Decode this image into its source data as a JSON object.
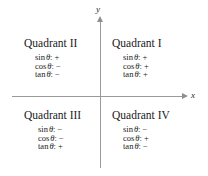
{
  "figure": {
    "title_semantic": "trigonometric-sign-quadrant-chart",
    "axes": {
      "x_label": "x",
      "y_label": "y",
      "axis_color": "#9a9a9a"
    },
    "quadrants": [
      {
        "id": "quadrant-1",
        "title": "Quadrant I",
        "rows": [
          {
            "func": "sin",
            "theta": "θ",
            "colon": ":",
            "sign": "+"
          },
          {
            "func": "cos",
            "theta": "θ",
            "colon": ":",
            "sign": "+"
          },
          {
            "func": "tan",
            "theta": "θ",
            "colon": ":",
            "sign": "+"
          }
        ]
      },
      {
        "id": "quadrant-2",
        "title": "Quadrant II",
        "rows": [
          {
            "func": "sin",
            "theta": "θ",
            "colon": ":",
            "sign": "+"
          },
          {
            "func": "cos",
            "theta": "θ",
            "colon": ":",
            "sign": "−"
          },
          {
            "func": "tan",
            "theta": "θ",
            "colon": ":",
            "sign": "−"
          }
        ]
      },
      {
        "id": "quadrant-3",
        "title": "Quadrant III",
        "rows": [
          {
            "func": "sin",
            "theta": "θ",
            "colon": ":",
            "sign": "−"
          },
          {
            "func": "cos",
            "theta": "θ",
            "colon": ":",
            "sign": "−"
          },
          {
            "func": "tan",
            "theta": "θ",
            "colon": ":",
            "sign": "+"
          }
        ]
      },
      {
        "id": "quadrant-4",
        "title": "Quadrant IV",
        "rows": [
          {
            "func": "sin",
            "theta": "θ",
            "colon": ":",
            "sign": "−"
          },
          {
            "func": "cos",
            "theta": "θ",
            "colon": ":",
            "sign": "+"
          },
          {
            "func": "tan",
            "theta": "θ",
            "colon": ":",
            "sign": "−"
          }
        ]
      }
    ]
  },
  "chart_data": {
    "type": "table",
    "title": "",
    "xlabel": "x",
    "ylabel": "y",
    "categories": [
      "Quadrant I",
      "Quadrant II",
      "Quadrant III",
      "Quadrant IV"
    ],
    "series": [
      {
        "name": "sin θ",
        "values": [
          "+",
          "+",
          "−",
          "−"
        ]
      },
      {
        "name": "cos θ",
        "values": [
          "+",
          "−",
          "−",
          "+"
        ]
      },
      {
        "name": "tan θ",
        "values": [
          "+",
          "−",
          "+",
          "−"
        ]
      }
    ],
    "grid": false,
    "legend": "none"
  }
}
